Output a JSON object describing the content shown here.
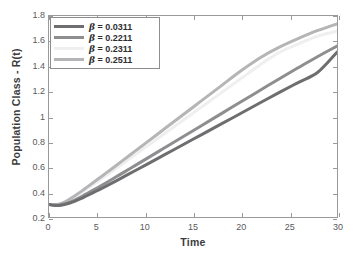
{
  "chart_data": {
    "type": "line",
    "title": "",
    "xlabel": "Time",
    "ylabel": "Population Class - R(t)",
    "xlim": [
      0,
      30
    ],
    "ylim": [
      0.2,
      1.8
    ],
    "xticks": [
      0,
      5,
      10,
      15,
      20,
      25,
      30
    ],
    "yticks": [
      0.2,
      0.4,
      0.6,
      0.8,
      1,
      1.2,
      1.4,
      1.6,
      1.8
    ],
    "xticklabels": [
      "0",
      "5",
      "10",
      "15",
      "20",
      "25",
      "30"
    ],
    "yticklabels": [
      "0.2",
      "0.4",
      "0.6",
      "0.8",
      "1",
      "1.2",
      "1.4",
      "1.6",
      "1.8"
    ],
    "grid": false,
    "legend_position": "top-left",
    "x": [
      0,
      0.5,
      1,
      1.5,
      2,
      2.5,
      3,
      3.5,
      4,
      5,
      6,
      7,
      8,
      9,
      10,
      12,
      14,
      16,
      18,
      20,
      22,
      24,
      26,
      28,
      30
    ],
    "series": [
      {
        "name": "β = 0.0311",
        "beta": 0.0311,
        "color": "#6e6e70",
        "values": [
          0.3,
          0.293,
          0.292,
          0.297,
          0.307,
          0.32,
          0.336,
          0.353,
          0.371,
          0.409,
          0.448,
          0.488,
          0.529,
          0.57,
          0.611,
          0.694,
          0.777,
          0.86,
          0.943,
          1.026,
          1.109,
          1.192,
          1.272,
          1.352,
          1.512
        ]
      },
      {
        "name": "β = 0.2211",
        "beta": 0.2211,
        "color": "#8e8e90",
        "values": [
          0.3,
          0.294,
          0.294,
          0.301,
          0.313,
          0.329,
          0.347,
          0.367,
          0.388,
          0.431,
          0.475,
          0.52,
          0.565,
          0.611,
          0.657,
          0.749,
          0.841,
          0.933,
          1.025,
          1.117,
          1.209,
          1.301,
          1.39,
          1.478,
          1.56
        ]
      },
      {
        "name": "β = 0.2311",
        "beta": 0.2311,
        "color": "#efefef",
        "values": [
          0.3,
          0.296,
          0.299,
          0.311,
          0.329,
          0.351,
          0.375,
          0.4,
          0.426,
          0.479,
          0.533,
          0.587,
          0.642,
          0.697,
          0.752,
          0.862,
          0.972,
          1.082,
          1.192,
          1.302,
          1.412,
          1.51,
          1.578,
          1.64,
          1.68
        ]
      },
      {
        "name": "β = 0.2511",
        "beta": 0.2511,
        "color": "#b5b5b7",
        "values": [
          0.3,
          0.297,
          0.301,
          0.315,
          0.335,
          0.359,
          0.385,
          0.412,
          0.44,
          0.496,
          0.553,
          0.61,
          0.668,
          0.726,
          0.784,
          0.9,
          1.016,
          1.132,
          1.248,
          1.364,
          1.468,
          1.552,
          1.622,
          1.685,
          1.738
        ]
      }
    ]
  },
  "legend": {
    "entries": [
      {
        "label": "β = 0.0311",
        "prefix": "β",
        "rest": " = 0.0311",
        "color": "#6e6e70"
      },
      {
        "label": "β = 0.2211",
        "prefix": "β",
        "rest": " = 0.2211",
        "color": "#8e8e90"
      },
      {
        "label": "β = 0.2311",
        "prefix": "β",
        "rest": " = 0.2311",
        "color": "#efefef"
      },
      {
        "label": "β = 0.2511",
        "prefix": "β",
        "rest": " = 0.2511",
        "color": "#b5b5b7"
      }
    ]
  },
  "style": {
    "axis_color": "#9a9a9a",
    "tick_label_color": "#59595b",
    "axis_title_color": "#3b3b3d",
    "background": "#ffffff",
    "legend_border": "#8e8e90"
  }
}
